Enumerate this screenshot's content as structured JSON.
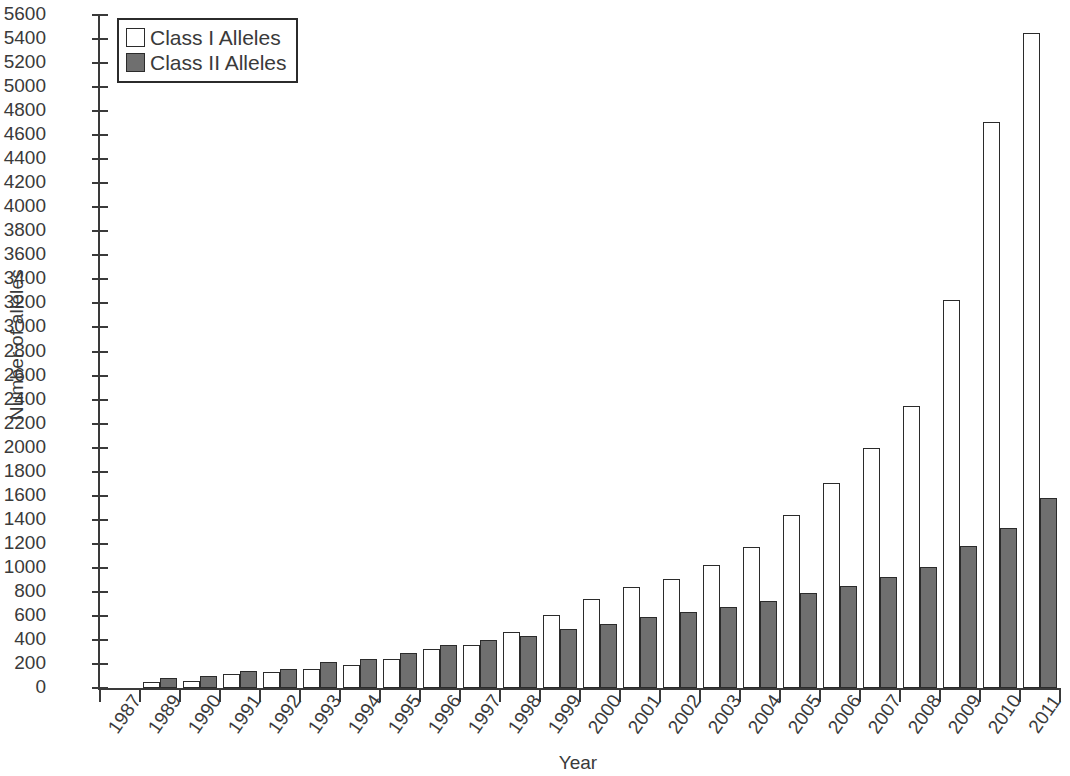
{
  "chart_data": {
    "type": "bar",
    "title": "",
    "xlabel": "Year",
    "ylabel": "Number of alleles",
    "ylim": [
      0,
      5600
    ],
    "ytick_step": 200,
    "grid": false,
    "legend_position": "top-left",
    "categories": [
      "1987",
      "1989",
      "1990",
      "1991",
      "1992",
      "1993",
      "1994",
      "1995",
      "1996",
      "1997",
      "1998",
      "1999",
      "2000",
      "2001",
      "2002",
      "2003",
      "2004",
      "2005",
      "2006",
      "2007",
      "2008",
      "2009",
      "2010",
      "2011"
    ],
    "series": [
      {
        "name": "Class I Alleles",
        "color": "#ffffff",
        "values": [
          0,
          50,
          60,
          115,
          135,
          155,
          195,
          245,
          325,
          360,
          470,
          610,
          740,
          840,
          910,
          1025,
          1175,
          1440,
          1710,
          2000,
          2350,
          3230,
          4710,
          5450
        ]
      },
      {
        "name": "Class II Alleles",
        "color": "#6f6f6f",
        "values": [
          0,
          85,
          100,
          145,
          155,
          215,
          245,
          290,
          360,
          400,
          430,
          490,
          530,
          590,
          630,
          670,
          720,
          790,
          850,
          920,
          1010,
          1180,
          1330,
          1580
        ]
      }
    ],
    "ytick_labels": [
      "0",
      "200",
      "400",
      "600",
      "800",
      "1000",
      "1200",
      "1400",
      "1600",
      "1800",
      "2000",
      "2200",
      "2400",
      "2600",
      "2800",
      "3000",
      "3200",
      "3400",
      "3600",
      "3800",
      "4000",
      "4200",
      "4400",
      "4600",
      "4800",
      "5000",
      "5200",
      "5400",
      "5600"
    ]
  },
  "legend": {
    "items": [
      {
        "label": "Class I Alleles",
        "swatch": "white-square-swatch"
      },
      {
        "label": "Class II Alleles",
        "swatch": "gray-square-swatch"
      }
    ]
  },
  "axes": {
    "x_title": "Year",
    "y_title": "Number of alleles"
  }
}
